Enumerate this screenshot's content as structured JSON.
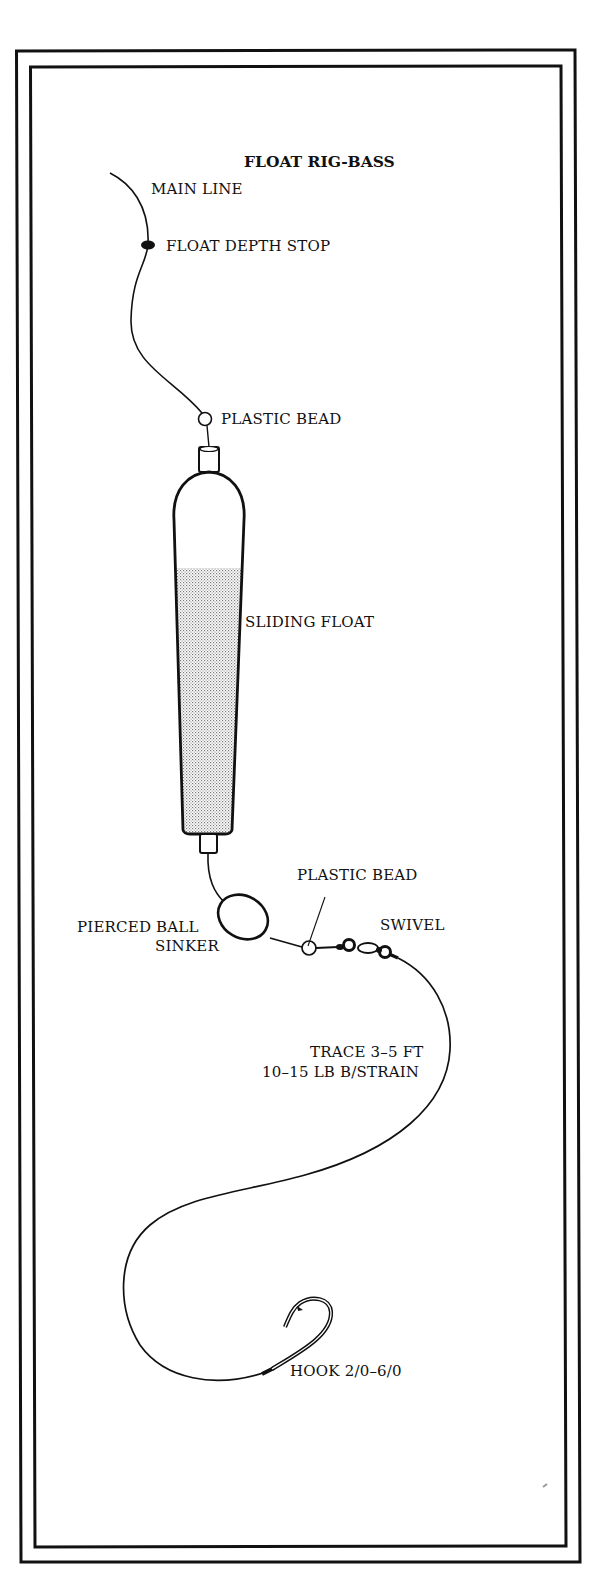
{
  "diagram": {
    "title": "FLOAT RIG-BASS",
    "colors": {
      "ink": "#111111",
      "paper": "#ffffff",
      "stipple": "#8a8a8a"
    },
    "labels": {
      "main_line": "MAIN LINE",
      "float_depth_stop": "FLOAT DEPTH STOP",
      "plastic_bead_top": "PLASTIC BEAD",
      "sliding_float": "SLIDING FLOAT",
      "plastic_bead_bottom": "PLASTIC BEAD",
      "pierced_ball_line1": "PIERCED BALL",
      "pierced_ball_line2": "SINKER",
      "swivel": "SWIVEL",
      "trace_line1": "TRACE 3–5 FT",
      "trace_line2": "10–15 LB B/STRAIN",
      "hook": "HOOK 2/0–6/0"
    }
  }
}
